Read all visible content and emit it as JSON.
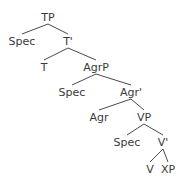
{
  "diagram": {
    "type": "syntax-tree",
    "background_color": "#ffffff",
    "line_color": "#4a4a4a",
    "text_color": "#3a3a3a",
    "nodes": [
      {
        "id": "TP",
        "label": "TP",
        "x": 48,
        "y": 12
      },
      {
        "id": "Spec_TP",
        "label": "Spec",
        "x": 22,
        "y": 36
      },
      {
        "id": "Tbar",
        "label": "T'",
        "x": 68,
        "y": 36
      },
      {
        "id": "T",
        "label": "T",
        "x": 44,
        "y": 62
      },
      {
        "id": "AgrP",
        "label": "AgrP",
        "x": 96,
        "y": 62
      },
      {
        "id": "Spec_AgrP",
        "label": "Spec",
        "x": 72,
        "y": 87
      },
      {
        "id": "Agrbar",
        "label": "Agr'",
        "x": 131,
        "y": 87
      },
      {
        "id": "Agr",
        "label": "Agr",
        "x": 99,
        "y": 112
      },
      {
        "id": "VP",
        "label": "VP",
        "x": 144,
        "y": 112
      },
      {
        "id": "Spec_VP",
        "label": "Spec",
        "x": 127,
        "y": 137
      },
      {
        "id": "Vbar",
        "label": "V'",
        "x": 163,
        "y": 137
      },
      {
        "id": "V",
        "label": "V",
        "x": 150,
        "y": 164
      },
      {
        "id": "XP",
        "label": "XP",
        "x": 168,
        "y": 164
      }
    ],
    "edges": [
      {
        "from": "TP",
        "to": "Spec_TP"
      },
      {
        "from": "TP",
        "to": "Tbar"
      },
      {
        "from": "Tbar",
        "to": "T"
      },
      {
        "from": "Tbar",
        "to": "AgrP"
      },
      {
        "from": "AgrP",
        "to": "Spec_AgrP"
      },
      {
        "from": "AgrP",
        "to": "Agrbar"
      },
      {
        "from": "Agrbar",
        "to": "Agr"
      },
      {
        "from": "Agrbar",
        "to": "VP"
      },
      {
        "from": "VP",
        "to": "Spec_VP"
      },
      {
        "from": "VP",
        "to": "Vbar"
      },
      {
        "from": "Vbar",
        "to": "V"
      },
      {
        "from": "Vbar",
        "to": "XP"
      }
    ]
  }
}
